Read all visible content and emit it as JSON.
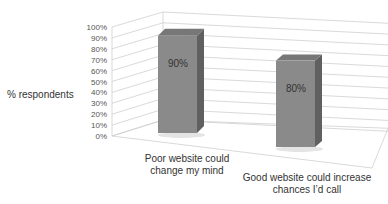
{
  "chart_data": {
    "type": "bar",
    "style": "3d",
    "title": "",
    "xlabel": "",
    "ylabel": "% respondents",
    "ylim": [
      0,
      100
    ],
    "yticks": [
      "0%",
      "10%",
      "20%",
      "30%",
      "40%",
      "50%",
      "60%",
      "70%",
      "80%",
      "90%",
      "100%"
    ],
    "grid": true,
    "legend": null,
    "categories": [
      "Poor website could change my mind",
      "Good website could increase chances I'd call"
    ],
    "category_lines": [
      [
        "Poor website could",
        "change my mind"
      ],
      [
        "Good website could increase",
        "chances I’d call"
      ]
    ],
    "values": [
      90,
      80
    ],
    "data_labels": [
      "90%",
      "80%"
    ],
    "colors": {
      "bar_front": "#8a8a8a",
      "bar_top": "#777777",
      "bar_side": "#606060",
      "grid": "#cfcfcf"
    }
  }
}
